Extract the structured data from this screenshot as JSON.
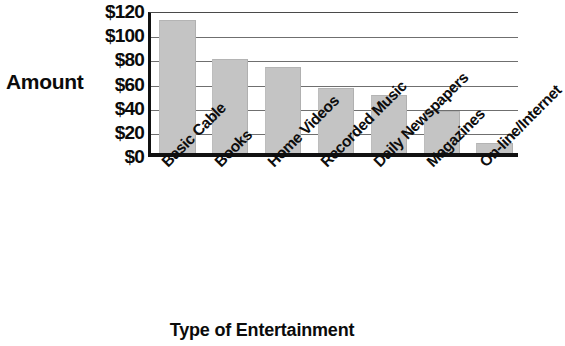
{
  "chart_data": {
    "type": "bar",
    "title": "",
    "xlabel": "Type of Entertainment",
    "ylabel": "Amount",
    "categories": [
      "Basic Cable",
      "Books",
      "Home Videos",
      "Recorded Music",
      "Daily Newspapers",
      "Magazines",
      "On-line/Internet"
    ],
    "values": [
      110,
      78,
      71,
      54,
      48,
      35,
      8
    ],
    "ylim": [
      0,
      120
    ],
    "yticks": [
      0,
      20,
      40,
      60,
      80,
      100,
      120
    ],
    "ytick_labels": [
      "$0",
      "$20",
      "$40",
      "$60",
      "$80",
      "$100",
      "$120"
    ],
    "grid": true,
    "legend": false,
    "bar_color": "#c4c4c4",
    "axis_color": "#111111",
    "gridline_color": "#6f6f6f",
    "text_color": "#0b0b0b"
  },
  "axes": {
    "y_title": "Amount",
    "x_title": "Type of Entertainment"
  }
}
